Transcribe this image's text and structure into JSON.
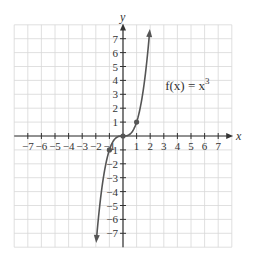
{
  "chart_data": {
    "type": "line",
    "title": "",
    "function_label": "f(x) = x^3",
    "function_label_parts": {
      "base": "f(x) = x",
      "exponent": "3"
    },
    "xlabel": "x",
    "ylabel": "y",
    "xlim": [
      -7.5,
      7.5
    ],
    "ylim": [
      -7.5,
      7.5
    ],
    "grid": true,
    "x_ticks": [
      -7,
      -6,
      -5,
      -4,
      -3,
      -2,
      -1,
      1,
      2,
      3,
      4,
      5,
      6,
      7
    ],
    "y_ticks": [
      -7,
      -6,
      -5,
      -4,
      -3,
      -2,
      -1,
      1,
      2,
      3,
      4,
      5,
      6,
      7
    ],
    "series": [
      {
        "name": "f(x) = x^3",
        "x": [
          -1.95,
          -1.5,
          -1,
          -0.5,
          0,
          0.5,
          1,
          1.5,
          1.95
        ],
        "y": [
          -7.41,
          -3.375,
          -1,
          -0.125,
          0,
          0.125,
          1,
          3.375,
          7.41
        ]
      }
    ],
    "highlighted_points": [
      {
        "x": -1,
        "y": -1
      },
      {
        "x": 0,
        "y": 0
      },
      {
        "x": 1,
        "y": 1
      }
    ],
    "colors": {
      "curve": "#555555",
      "grid": "#d8d8d8",
      "axis": "#333333"
    }
  }
}
